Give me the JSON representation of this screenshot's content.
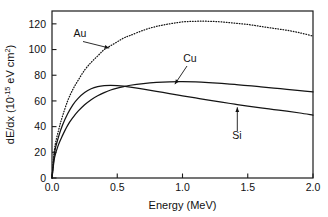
{
  "chart_data": {
    "type": "line",
    "title": "",
    "xlabel": "Energy (MeV)",
    "ylabel": "dE/dx (10-15 eV cm2)",
    "ylabel_parts": {
      "prefix": "dE/dx (10",
      "exponent": "-15",
      "middle": " eV cm",
      "superscript": "2",
      "suffix": ")"
    },
    "xlim": [
      0.0,
      2.0
    ],
    "ylim": [
      0,
      130
    ],
    "xticks": [
      0.0,
      0.5,
      1.0,
      1.5,
      2.0
    ],
    "xticklabels": [
      "0.0",
      "0.5",
      "1.0",
      "1.5",
      "2.0"
    ],
    "yticks": [
      0,
      20,
      40,
      60,
      80,
      100,
      120
    ],
    "yticklabels": [
      "0",
      "20",
      "40",
      "60",
      "80",
      "100",
      "120"
    ],
    "grid": false,
    "legend_position": "inline-annotations",
    "x": [
      0.0,
      0.02,
      0.05,
      0.08,
      0.12,
      0.16,
      0.2,
      0.25,
      0.3,
      0.35,
      0.4,
      0.45,
      0.5,
      0.55,
      0.6,
      0.7,
      0.8,
      0.9,
      1.0,
      1.1,
      1.2,
      1.3,
      1.4,
      1.5,
      1.6,
      1.7,
      1.8,
      1.9,
      2.0
    ],
    "series": [
      {
        "name": "Au",
        "style": "dotted",
        "label": "Au",
        "peak_x": 1.05,
        "peak_y": 122,
        "values": [
          0,
          23,
          37,
          48,
          60,
          69,
          76,
          84,
          90,
          95,
          100,
          103,
          106,
          109,
          111,
          115,
          118,
          120,
          121.5,
          122,
          122,
          121.5,
          120.5,
          119.5,
          118,
          116.5,
          115,
          113,
          110.5
        ]
      },
      {
        "name": "Cu",
        "style": "solid",
        "label": "Cu",
        "peak_x": 0.95,
        "peak_y": 75,
        "values": [
          0,
          16,
          26,
          33,
          41,
          47,
          52,
          57,
          61,
          64,
          66.5,
          68.5,
          70,
          71.2,
          72.2,
          73.5,
          74.4,
          74.9,
          75,
          74.8,
          74.3,
          73.6,
          72.8,
          72,
          71,
          70,
          69,
          68,
          67
        ]
      },
      {
        "name": "Si",
        "style": "solid",
        "label": "Si",
        "peak_x": 0.45,
        "peak_y": 72,
        "values": [
          0,
          20,
          32,
          41,
          50,
          57,
          62,
          66.5,
          69.5,
          71.2,
          72,
          72.2,
          72,
          71.5,
          70.8,
          69.2,
          67.5,
          65.7,
          64,
          62.3,
          60.6,
          59,
          57.5,
          56,
          54.6,
          53.3,
          52,
          50.6,
          49
        ]
      }
    ],
    "annotations": [
      {
        "text": "Au",
        "target_x": 0.45,
        "target_y": 100,
        "arrow": "down-right"
      },
      {
        "text": "Cu",
        "target_x": 0.93,
        "target_y": 75,
        "arrow": "down-left"
      },
      {
        "text": "Si",
        "target_x": 1.42,
        "target_y": 57,
        "arrow": "up"
      }
    ]
  }
}
